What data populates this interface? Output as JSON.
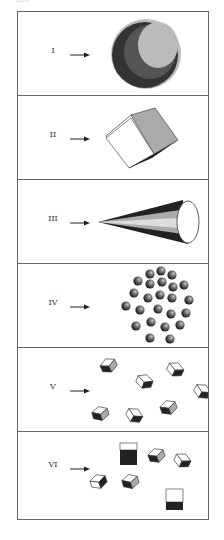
{
  "page": {
    "number": "200"
  },
  "panels": [
    {
      "label": "I",
      "figure": "sphere",
      "description": "Shaded sphere"
    },
    {
      "label": "II",
      "figure": "cube",
      "description": "Single tilted cube"
    },
    {
      "label": "III",
      "figure": "cone",
      "description": "Cone pointing left"
    },
    {
      "label": "IV",
      "figure": "sphere-cluster",
      "description": "Cluster of small spheres"
    },
    {
      "label": "V",
      "figure": "scattered-cubes",
      "description": "Scattered tilted cubes"
    },
    {
      "label": "VI",
      "figure": "scattered-cubes-and-squares",
      "description": "Scattered cubes with two front-facing squares"
    }
  ],
  "colors": {
    "dark": "#222222",
    "mid": "#555555",
    "light": "#bbbbbb",
    "white": "#ffffff",
    "border": "#666666"
  }
}
